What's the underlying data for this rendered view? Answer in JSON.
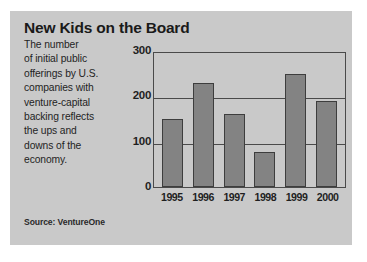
{
  "card": {
    "title": "New Kids on the Board",
    "blurb_lines": [
      "The number",
      "of initial public",
      "offerings by U.S.",
      "companies with",
      "venture-capital",
      "backing reflects",
      "the ups and",
      "downs of the",
      "economy."
    ],
    "source": "Source: VentureOne",
    "background_color": "#c9c9c9",
    "page_background_color": "#ffffff"
  },
  "chart_data": {
    "type": "bar",
    "title": "New Kids on the Board",
    "xlabel": "",
    "ylabel": "",
    "categories": [
      "1995",
      "1996",
      "1997",
      "1998",
      "1999",
      "2000"
    ],
    "values": [
      150,
      230,
      160,
      78,
      250,
      190
    ],
    "ylim": [
      0,
      300
    ],
    "yticks": [
      0,
      100,
      200,
      300
    ],
    "grid": true,
    "grid_axis": "y",
    "legend": false,
    "legend_position": "none",
    "bar_color": "#838383",
    "bar_edge_color": "#3d3d3d",
    "axis_color": "#4a4a4a",
    "source": "Source: VentureOne"
  }
}
